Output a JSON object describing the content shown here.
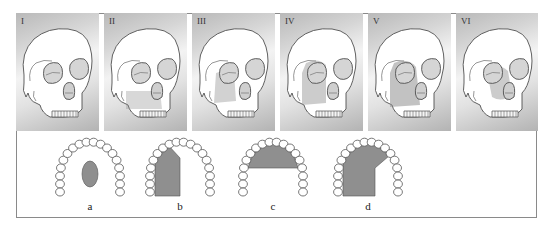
{
  "figure": {
    "type": "anatomical diagram",
    "colors": {
      "panel_gradient_dark": "#b3b3b3",
      "panel_gradient_light": "#f3f3f3",
      "defect_fill": "#8f8f8f",
      "outline": "#555555",
      "frame": "#8a8a8a"
    }
  },
  "skull_panels": [
    {
      "label": "I",
      "defect": "none"
    },
    {
      "label": "II",
      "defect": "maxilla lower"
    },
    {
      "label": "III",
      "defect": "orbit floor + maxilla"
    },
    {
      "label": "IV",
      "defect": "orbit + maxilla"
    },
    {
      "label": "V",
      "defect": "orbit + maxilla extended"
    },
    {
      "label": "VI",
      "defect": "nasal/orbit midface"
    }
  ],
  "arch_panels": [
    {
      "label": "a",
      "defect": "central palatal oval"
    },
    {
      "label": "b",
      "defect": "unilateral lateral"
    },
    {
      "label": "c",
      "defect": "anterior"
    },
    {
      "label": "d",
      "defect": "unilateral extended"
    }
  ]
}
